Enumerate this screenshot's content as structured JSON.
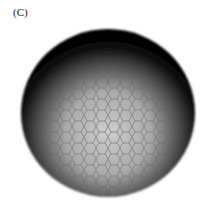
{
  "figure": {
    "panel_label": "(C)",
    "colors": {
      "background": "#ffffff",
      "rim": "#0a0a0a",
      "interior_light": "#c8c8c8",
      "cell_border": "#5a5a5a"
    }
  }
}
